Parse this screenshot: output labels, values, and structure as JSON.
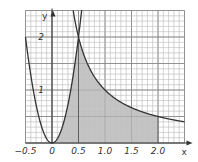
{
  "chart_data": {
    "type": "line",
    "title": "",
    "xlabel": "x",
    "ylabel": "y",
    "xlim": [
      -0.5,
      2.5
    ],
    "ylim": [
      0,
      2.5
    ],
    "grid": true,
    "grid_minor_step": 0.1,
    "grid_major_step": 0.5,
    "x_ticks": [
      -0.5,
      0,
      0.5,
      1.0,
      1.5,
      2.0
    ],
    "x_tick_labels": [
      "−0.5",
      "0",
      "0.5",
      "1.0",
      "1.5",
      "2.0"
    ],
    "y_ticks": [
      1,
      2
    ],
    "y_tick_labels": [
      "1",
      "2"
    ],
    "series": [
      {
        "name": "parabola y = 8x²",
        "formula": "8*x^2",
        "x_range": [
          -0.5,
          0.56
        ]
      },
      {
        "name": "hyperbola y = 1/x",
        "formula": "1/x",
        "x_range": [
          0.4,
          2.5
        ]
      }
    ],
    "shaded_region": {
      "description": "area under y=8x² from x=0 to 0.5 and under y=1/x from x=0.5 to 2",
      "x_from": 0,
      "x_mid": 0.5,
      "x_to": 2.0
    },
    "colors": {
      "curve": "#333333",
      "shade": "#c4c4c4",
      "grid_minor": "#bdbdbd",
      "grid_major": "#8a8a8a"
    }
  }
}
